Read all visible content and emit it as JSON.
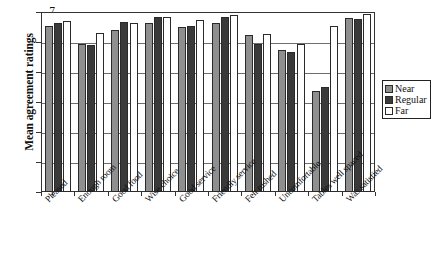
{
  "chart_data": {
    "type": "bar",
    "title": "",
    "xlabel": "",
    "ylabel": "Mean agreement ratings",
    "ylim": [
      1,
      7
    ],
    "yticks": [
      1,
      2,
      3,
      4,
      5,
      6,
      7
    ],
    "grid": true,
    "legend_position": "right",
    "categories": [
      "Pleased",
      "Enough room",
      "Good food",
      "Wise choice",
      "Good service",
      "Friendly service",
      "Felt rushed",
      "Uncomfortable",
      "Tables well spaced",
      "Was satisfied"
    ],
    "series": [
      {
        "name": "Near",
        "color": "#8f8f8f",
        "values": [
          6.55,
          5.95,
          6.4,
          6.65,
          6.5,
          6.63,
          6.22,
          5.72,
          4.37,
          6.8
        ]
      },
      {
        "name": "Regular",
        "color": "#3a3a3a",
        "values": [
          6.65,
          5.9,
          6.68,
          6.85,
          6.55,
          6.83,
          5.92,
          5.67,
          4.5,
          6.76
        ]
      },
      {
        "name": "Far",
        "color": "#ffffff",
        "values": [
          6.7,
          6.3,
          6.65,
          6.82,
          6.72,
          6.9,
          6.27,
          5.95,
          6.55,
          6.95
        ]
      }
    ]
  },
  "legend": {
    "entries": [
      {
        "label": "Near"
      },
      {
        "label": "Regular"
      },
      {
        "label": "Far"
      }
    ]
  }
}
